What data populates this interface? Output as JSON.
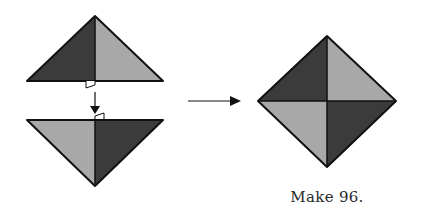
{
  "caption": "Make 96.",
  "colors": {
    "dark": "#3b3b3b",
    "light": "#a8a8a8",
    "stroke": "#111111",
    "background": "#ffffff"
  },
  "diagram": {
    "top_triangle": {
      "apex": [
        95,
        16
      ],
      "base_left": [
        27,
        81
      ],
      "base_right": [
        163,
        81
      ],
      "left_half": "dark",
      "right_half": "light"
    },
    "bottom_triangle": {
      "top_left": [
        27,
        120
      ],
      "top_right": [
        163,
        120
      ],
      "apex": [
        95,
        186
      ],
      "left_half": "light",
      "right_half": "dark"
    },
    "join_arrow": {
      "from": [
        95,
        92
      ],
      "to": [
        95,
        114
      ],
      "direction": "down"
    },
    "result_arrow": {
      "from": [
        188,
        101
      ],
      "to": [
        241,
        101
      ],
      "direction": "right"
    },
    "result_square": {
      "top": [
        327,
        36
      ],
      "left": [
        258,
        101
      ],
      "right": [
        396,
        101
      ],
      "bottom": [
        327,
        167
      ],
      "quadrants": {
        "top_left": "dark",
        "top_right": "light",
        "bottom_left": "light",
        "bottom_right": "dark"
      }
    }
  }
}
